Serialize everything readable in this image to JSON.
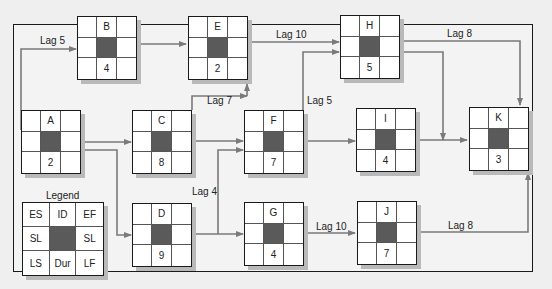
{
  "diagram": {
    "type": "precedence-network",
    "nodes": [
      {
        "id": "A",
        "duration": "2"
      },
      {
        "id": "B",
        "duration": "4"
      },
      {
        "id": "C",
        "duration": "8"
      },
      {
        "id": "D",
        "duration": "9"
      },
      {
        "id": "E",
        "duration": "2"
      },
      {
        "id": "F",
        "duration": "7"
      },
      {
        "id": "G",
        "duration": "4"
      },
      {
        "id": "H",
        "duration": "5"
      },
      {
        "id": "I",
        "duration": "4"
      },
      {
        "id": "J",
        "duration": "7"
      },
      {
        "id": "K",
        "duration": "3"
      }
    ],
    "lag_labels": {
      "a_b": "Lag 5",
      "e_h": "Lag 10",
      "c_e": "Lag 7",
      "f_h": "Lag 5",
      "h_k": "Lag 8",
      "d_f": "Lag 4",
      "g_j": "Lag 10",
      "j_k": "Lag 8"
    },
    "legend": {
      "title": "Legend",
      "cells": [
        "ES",
        "ID",
        "EF",
        "SL",
        "",
        "SL",
        "LS",
        "Dur",
        "LF"
      ]
    },
    "colors": {
      "arrow": "#7a7a7a",
      "frame": "#1a1a1a",
      "center_cell": "#5a5a5a",
      "background": "#efefef"
    }
  }
}
